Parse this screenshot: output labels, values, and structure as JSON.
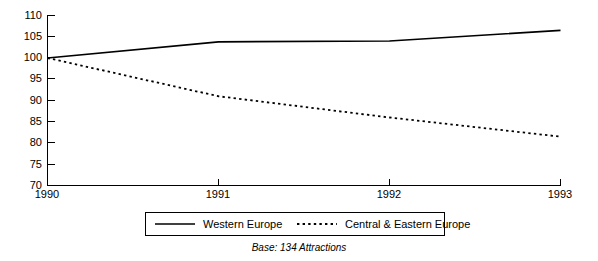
{
  "chart_data": {
    "type": "line",
    "title": "",
    "subtitle": "",
    "xlabel": "",
    "ylabel": "",
    "categories": [
      "1990",
      "1991",
      "1992",
      "1993"
    ],
    "x": [
      1990,
      1991,
      1992,
      1993
    ],
    "xlim": [
      1990,
      1993
    ],
    "ylim": [
      70,
      110
    ],
    "yticks": [
      70,
      75,
      80,
      85,
      90,
      95,
      100,
      105,
      110
    ],
    "ytick_labels": [
      "70",
      "75",
      "80",
      "85",
      "90",
      "95",
      "100",
      "105",
      "110"
    ],
    "xtick_labels": [
      "1990",
      "1991",
      "1992",
      "1993"
    ],
    "grid": false,
    "legend_position": "bottom",
    "series": [
      {
        "name": "Western Europe",
        "style": "solid",
        "color": "#000000",
        "values": [
          100,
          103.8,
          104.0,
          106.5
        ]
      },
      {
        "name": "Central & Eastern Europe",
        "style": "dotted",
        "color": "#000000",
        "values": [
          100,
          91.0,
          86.0,
          81.5
        ]
      }
    ],
    "annotations": [
      "Base: 134 Attractions"
    ]
  },
  "legend": {
    "items": [
      {
        "label": "Western Europe",
        "style": "solid"
      },
      {
        "label": "Central & Eastern Europe",
        "style": "dotted"
      }
    ]
  },
  "caption": {
    "text": "Base: 134 Attractions"
  },
  "axes": {
    "y": {
      "labels": [
        "110",
        "105",
        "100",
        "95",
        "90",
        "85",
        "80",
        "75",
        "70"
      ]
    },
    "x": {
      "labels": [
        "1990",
        "1991",
        "1992",
        "1993"
      ]
    }
  }
}
